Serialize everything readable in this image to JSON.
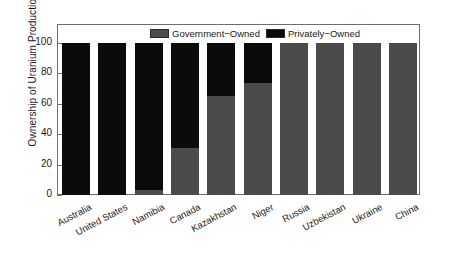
{
  "chart_data": {
    "type": "bar",
    "subtype": "stacked-percentage",
    "title": "",
    "xlabel": "",
    "ylabel": "Ownership of Uranium Production (%)",
    "ylim": [
      0,
      100
    ],
    "yticks": [
      0,
      20,
      40,
      60,
      80,
      100
    ],
    "ytick_labels": [
      "0",
      "20",
      "40",
      "60",
      "80",
      "100"
    ],
    "grid": false,
    "legend_position": "top-center",
    "categories": [
      "Australia",
      "United States",
      "Namibia",
      "Canada",
      "Kazakhstan",
      "Niger",
      "Russia",
      "Uzbekistan",
      "Ukraine",
      "China"
    ],
    "series": [
      {
        "name": "Government-Owned",
        "color": "#4b4b4b",
        "values": [
          0,
          0,
          3,
          31,
          65,
          74,
          100,
          100,
          100,
          100
        ]
      },
      {
        "name": "Privately-Owned",
        "color": "#0b0b0b",
        "values": [
          100,
          100,
          97,
          69,
          35,
          26,
          0,
          0,
          0,
          0
        ]
      }
    ]
  },
  "legend": {
    "items": [
      {
        "label": "Government−Owned",
        "swatch": "gov-swatch"
      },
      {
        "label": "Privately−Owned",
        "swatch": "priv-swatch"
      }
    ]
  },
  "axes": {
    "y_title": "Ownership of Uranium Production (%)"
  },
  "colors": {
    "government": "#4b4b4b",
    "private": "#0b0b0b",
    "axis": "#6d6d6d",
    "background": "#ffffff",
    "text": "#1a1a1a"
  }
}
